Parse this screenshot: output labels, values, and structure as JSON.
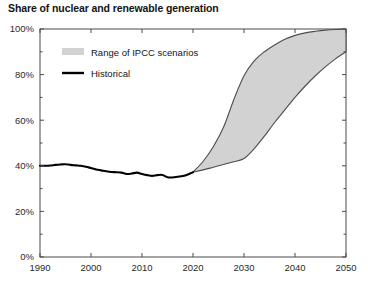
{
  "chart_data": {
    "type": "area",
    "title": "Share of nuclear and renewable generation",
    "xlabel": "",
    "ylabel": "",
    "xlim": [
      1990,
      2050
    ],
    "ylim": [
      0,
      100
    ],
    "grid": false,
    "y_unit": "%",
    "x_ticks": [
      1990,
      2000,
      2010,
      2020,
      2030,
      2040,
      2050
    ],
    "x_tick_labels": [
      "1990",
      "2000",
      "2010",
      "2020",
      "2030",
      "2040",
      "2050"
    ],
    "y_ticks": [
      0,
      20,
      40,
      60,
      80,
      100
    ],
    "y_tick_labels": [
      "0%",
      "20%",
      "40%",
      "60%",
      "80%",
      "100%"
    ],
    "y_minor_ticks": [
      10,
      30,
      50,
      70,
      90
    ],
    "legend_position": "top-left-inside",
    "legend": [
      {
        "label": "Range of IPCC scenarios",
        "marker": "band",
        "color": "#d2d2d2"
      },
      {
        "label": "Historical",
        "marker": "line",
        "color": "#000000"
      }
    ],
    "series": [
      {
        "name": "Historical",
        "type": "line",
        "color": "#000000",
        "x": [
          1990,
          1991,
          1992,
          1993,
          1994,
          1995,
          1996,
          1997,
          1998,
          1999,
          2000,
          2001,
          2002,
          2003,
          2004,
          2005,
          2006,
          2007,
          2008,
          2009,
          2010,
          2011,
          2012,
          2013,
          2014,
          2015,
          2016,
          2017,
          2018,
          2019,
          2020
        ],
        "values": [
          40.0,
          40.0,
          40.1,
          40.4,
          40.6,
          40.7,
          40.4,
          40.2,
          40.0,
          39.6,
          39.0,
          38.4,
          38.0,
          37.6,
          37.3,
          37.2,
          37.0,
          36.4,
          36.6,
          37.0,
          36.4,
          35.9,
          35.6,
          35.9,
          36.0,
          35.0,
          34.9,
          35.2,
          35.5,
          36.2,
          37.2
        ]
      },
      {
        "name": "Range of IPCC scenarios upper",
        "type": "band-upper",
        "color": "#d2d2d2",
        "x": [
          2020,
          2022,
          2024,
          2026,
          2028,
          2030,
          2032,
          2034,
          2036,
          2038,
          2040,
          2042,
          2044,
          2046,
          2048,
          2050
        ],
        "values": [
          37.2,
          42.0,
          48.5,
          57.0,
          69.0,
          79.5,
          86.0,
          90.0,
          93.0,
          95.5,
          97.2,
          98.3,
          99.0,
          99.5,
          99.8,
          100.0
        ]
      },
      {
        "name": "Range of IPCC scenarios lower",
        "type": "band-lower",
        "color": "#d2d2d2",
        "x": [
          2020,
          2022,
          2024,
          2026,
          2028,
          2030,
          2032,
          2034,
          2036,
          2038,
          2040,
          2042,
          2044,
          2046,
          2048,
          2050
        ],
        "values": [
          37.2,
          38.2,
          39.4,
          40.6,
          41.8,
          43.2,
          47.5,
          53.0,
          59.0,
          64.5,
          70.0,
          75.0,
          79.5,
          83.5,
          87.0,
          90.0
        ]
      }
    ]
  },
  "legend": {
    "band_label": "Range of IPCC scenarios",
    "line_label": "Historical"
  }
}
